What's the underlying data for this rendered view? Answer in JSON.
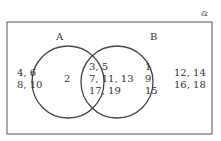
{
  "universal_symbol": "&",
  "sets": [
    {
      "label": "A"
    },
    {
      "label": "B"
    }
  ],
  "regions": {
    "outside_left": [
      "4, 6",
      "8, 10"
    ],
    "a_only": [
      "2"
    ],
    "intersection": [
      "3, 5",
      "7, 11, 13",
      "17, 19"
    ],
    "b_only": [
      "1",
      "9",
      "15"
    ],
    "outside_right": [
      "12, 14",
      "16, 18"
    ]
  },
  "colors": {
    "stroke": "#444444",
    "text": "#333333"
  }
}
